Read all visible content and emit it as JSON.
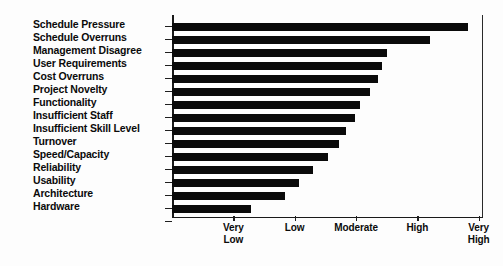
{
  "chart_data": {
    "type": "bar",
    "orientation": "horizontal",
    "title": "",
    "subtitle": "",
    "xlabel": "",
    "ylabel": "",
    "grid": false,
    "legend": null,
    "xlim": [
      0,
      5.07
    ],
    "x_tick_values": [
      1,
      2,
      3,
      4,
      5
    ],
    "x_tick_labels": [
      "Very\nLow",
      "Low",
      "Moderate",
      "High",
      "Very\nHigh"
    ],
    "categories": [
      "Schedule Pressure",
      "Schedule Overruns",
      "Management Disagree",
      "User Requirements",
      "Cost Overruns",
      "Project Novelty",
      "Functionality",
      "Insufficient Staff",
      "Insufficient Skill Level",
      "Turnover",
      "Speed/Capacity",
      "Reliability",
      "Usability",
      "Architecture",
      "Hardware"
    ],
    "values": [
      4.83,
      4.21,
      3.51,
      3.43,
      3.36,
      3.23,
      3.06,
      2.98,
      2.83,
      2.72,
      2.55,
      2.3,
      2.07,
      1.84,
      1.28
    ],
    "bar_color": "#0a0a0a",
    "axis_color": "#1a1a1a",
    "background_color": "#fdfdfd"
  }
}
